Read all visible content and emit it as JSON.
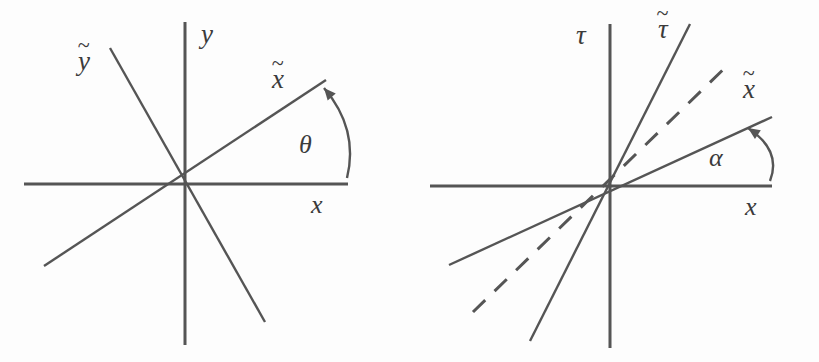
{
  "figure": {
    "width": 819,
    "height": 362,
    "background_color": "#fdfdfd",
    "stroke_color": "#555555",
    "text_color": "#3b3b3b"
  },
  "panels": [
    {
      "id": "euclidean-rotation",
      "name": "euclidean-rotation-panel",
      "origin": {
        "x": 185,
        "y": 184
      },
      "axes": [
        {
          "name": "x-axis",
          "label": "x",
          "tilde": false,
          "x1": 24,
          "y1": 184,
          "x2": 348,
          "y2": 184
        },
        {
          "name": "y-axis",
          "label": "y",
          "tilde": false,
          "x1": 185,
          "y1": 22,
          "x2": 185,
          "y2": 345
        }
      ],
      "rotated_axes": [
        {
          "name": "x-tilde-axis",
          "label": "x",
          "tilde": true,
          "x1": 44,
          "y1": 266,
          "x2": 326,
          "y2": 80
        },
        {
          "name": "y-tilde-axis",
          "label": "y",
          "tilde": true,
          "x1": 110,
          "y1": 48,
          "x2": 265,
          "y2": 322
        }
      ],
      "angle_arc": {
        "name": "theta-angle-arrow",
        "label": "θ",
        "from": {
          "x": 347,
          "y": 178
        },
        "to": {
          "x": 324,
          "y": 88
        }
      },
      "labels": [
        {
          "name": "label-y-tilde",
          "text": "y",
          "tilde": true,
          "x": 78,
          "y": 48,
          "size": 27
        },
        {
          "name": "label-y",
          "text": "y",
          "tilde": false,
          "x": 201,
          "y": 21,
          "size": 27
        },
        {
          "name": "label-x-tilde",
          "text": "x",
          "tilde": true,
          "x": 272,
          "y": 66,
          "size": 27
        },
        {
          "name": "label-theta",
          "text": "θ",
          "tilde": false,
          "x": 299,
          "y": 132,
          "size": 26
        },
        {
          "name": "label-x",
          "text": "x",
          "tilde": false,
          "x": 311,
          "y": 192,
          "size": 26
        }
      ]
    },
    {
      "id": "lorentz-boost",
      "name": "lorentz-boost-panel",
      "origin": {
        "x": 610,
        "y": 186
      },
      "axes": [
        {
          "name": "x-axis",
          "label": "x",
          "tilde": false,
          "x1": 430,
          "y1": 186,
          "x2": 772,
          "y2": 186
        },
        {
          "name": "tau-axis",
          "label": "τ",
          "tilde": false,
          "x1": 610,
          "y1": 24,
          "x2": 610,
          "y2": 348
        }
      ],
      "rotated_axes": [
        {
          "name": "x-tilde-axis",
          "label": "x",
          "tilde": true,
          "x1": 449,
          "y1": 265,
          "x2": 772,
          "y2": 117
        },
        {
          "name": "tau-tilde-axis",
          "label": "τ",
          "tilde": true,
          "x1": 530,
          "y1": 341,
          "x2": 690,
          "y2": 24
        }
      ],
      "light_cone": {
        "name": "light-cone-dashed-line",
        "dashed": true,
        "x1": 473,
        "y1": 312,
        "x2": 731,
        "y2": 62
      },
      "angle_arc": {
        "name": "alpha-angle-arrow",
        "label": "α",
        "from": {
          "x": 770,
          "y": 181
        },
        "to": {
          "x": 748,
          "y": 128
        }
      },
      "labels": [
        {
          "name": "label-tau",
          "text": "τ",
          "tilde": false,
          "x": 576,
          "y": 22,
          "size": 27
        },
        {
          "name": "label-tau-tilde",
          "text": "τ",
          "tilde": true,
          "x": 658,
          "y": 16,
          "size": 27
        },
        {
          "name": "label-x-tilde",
          "text": "x",
          "tilde": true,
          "x": 743,
          "y": 76,
          "size": 27
        },
        {
          "name": "label-alpha",
          "text": "α",
          "tilde": false,
          "x": 709,
          "y": 145,
          "size": 26
        },
        {
          "name": "label-x",
          "text": "x",
          "tilde": false,
          "x": 745,
          "y": 194,
          "size": 26
        }
      ],
      "formula": {
        "name": "beta-definition-formula",
        "lhs": "β",
        "operator": "=",
        "function": "tan",
        "open_paren": "(",
        "argument": "α",
        "close_paren": ")",
        "full_text": "β = tan(α)",
        "x": 661,
        "y": 263,
        "size": 30
      }
    }
  ],
  "tilde_glyph": "~"
}
